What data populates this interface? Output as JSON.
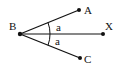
{
  "diagram": {
    "type": "geometry-angle",
    "points": [
      {
        "id": "B",
        "label": "B",
        "x": 20,
        "y": 34
      },
      {
        "id": "A",
        "label": "A",
        "x": 79,
        "y": 10
      },
      {
        "id": "X",
        "label": "X",
        "x": 103,
        "y": 34
      },
      {
        "id": "C",
        "label": "C",
        "x": 80,
        "y": 58
      }
    ],
    "rays": [
      {
        "from": "B",
        "to": "A"
      },
      {
        "from": "B",
        "to": "X"
      },
      {
        "from": "B",
        "to": "C"
      }
    ],
    "angles": [
      {
        "between": [
          "BA",
          "BX"
        ],
        "label": "a"
      },
      {
        "between": [
          "BX",
          "BC"
        ],
        "label": "a"
      }
    ],
    "colors": {
      "stroke": "#111111",
      "background": "#ffffff"
    }
  }
}
